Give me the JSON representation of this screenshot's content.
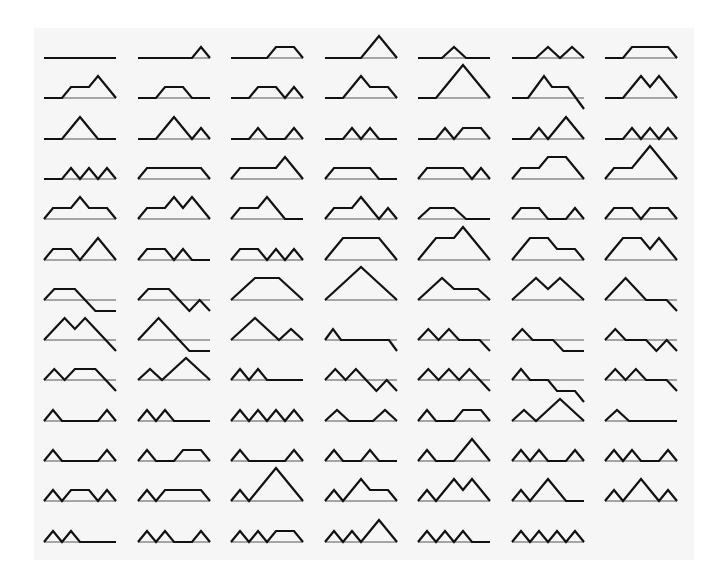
{
  "figure": {
    "columns": 7,
    "colors": {
      "path": "#111111",
      "baseline": "#555555",
      "background": "#f6f6f6"
    },
    "paths": [
      "HHHH",
      "HHHUD",
      "HHUHD",
      "HHUUDD",
      "HUDH",
      "HUDUD",
      "HUHHD",
      "HUHUDD",
      "HUHDH",
      "HUHDUD",
      "HUUDHD",
      "HUUUDDD",
      "HUUDHDD",
      "HUUDUDD",
      "HUUDDH",
      "HUUDDUD",
      "HUDHUD",
      "HUDUDH",
      "HUDUHD",
      "HUDUUDD",
      "HUDUDUD",
      "HUDUDUD",
      "UHHHD",
      "UHHUDD",
      "UHHDH",
      "UHHDUD",
      "UHUHDD",
      "UHUUDDD",
      "UHUDHD",
      "UHUDUDD",
      "UHUDDH",
      "UHUDDUD",
      "UHDH",
      "UHDHUD",
      "UHDUHD",
      "UHDUUDD",
      "UHDUDH",
      "UHDUDUD",
      "UUHHDD",
      "UUHUDDD",
      "UUHDHD",
      "UUHDUDD",
      "UHDDH",
      "UHDDUD",
      "UUHDD",
      "UUUDDD",
      "UUDHD",
      "UUDUDD",
      "UUDDHD",
      "UUDUDDD",
      "UUDDDH",
      "UUDDUD",
      "UDHHHD",
      "UDUDHD",
      "UDHDH",
      "UDHDUD",
      "UDUHDD",
      "UDUUDD",
      "UDUDHH",
      "UDUDDUD",
      "UDUDUDD",
      "UDHDHD",
      "UDUDHD",
      "UDHHUD",
      "UDUDHH",
      "UDUDUDUD",
      "UDHUD",
      "UDHUHD",
      "UDUUDD",
      "UDHH",
      "UDHHUD",
      "UDHUHD",
      "UDHHUD",
      "UDHUDH",
      "UDHUUDD",
      "UDUDHUD",
      "UDUDHUD",
      "UDUHDUD",
      "UDUHHD",
      "UDUUUDDD",
      "UDUUDHD",
      "UDUUDUDD",
      "UDUUDDH",
      "UDUUDDUD",
      "UDUDHH",
      "UDUDHUD",
      "UDUDUHD",
      "UDUDUUDD",
      "UDUDUDH",
      "UDUDUDUD"
    ]
  }
}
